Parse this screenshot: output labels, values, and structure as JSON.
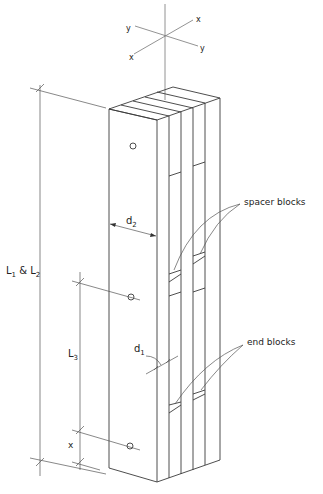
{
  "diagram": {
    "type": "isometric technical drawing",
    "axes": {
      "labels": [
        "x",
        "y",
        "y",
        "x"
      ]
    },
    "dimensions": {
      "overall_length": {
        "main": "L",
        "sub1": "1",
        "amp": " & ",
        "main2": "L",
        "sub2": "2"
      },
      "spacer_spacing": {
        "main": "L",
        "sub": "3"
      },
      "end_distance": {
        "main": "x"
      },
      "width": {
        "main": "d",
        "sub": "2"
      },
      "thickness": {
        "main": "d",
        "sub": "1"
      }
    },
    "callouts": {
      "spacer_blocks": "spacer blocks",
      "end_blocks": "end blocks"
    },
    "colors": {
      "line": "#3a3a3a",
      "background": "#ffffff"
    }
  }
}
